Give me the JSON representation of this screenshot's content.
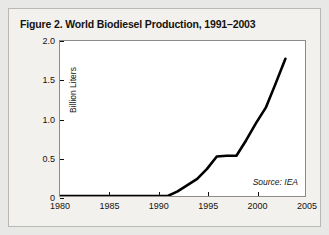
{
  "figure": {
    "title": "Figure 2. World Biodiesel Production, 1991–2003",
    "source_note": "Source: IEA"
  },
  "chart_data": {
    "type": "line",
    "title": "Figure 2. World Biodiesel Production, 1991–2003",
    "xlabel": "",
    "ylabel": "Billion Liters",
    "xlim": [
      1980,
      2005
    ],
    "ylim": [
      0,
      2.0
    ],
    "grid": false,
    "legend": null,
    "annotations": [
      "Source: IEA"
    ],
    "xticks": [
      1980,
      1985,
      1990,
      1995,
      2000,
      2005
    ],
    "xtick_labels": [
      "1980",
      "1985",
      "1990",
      "1995",
      "2000",
      "2005"
    ],
    "yticks": [
      0,
      0.5,
      1.0,
      1.5,
      2.0
    ],
    "ytick_labels": [
      "0",
      "0.5",
      "1.0",
      "1.5",
      "2.0"
    ],
    "line_color": "#000000",
    "line_width": 2.6,
    "x": [
      1991,
      1992,
      1993,
      1994,
      1995,
      1996,
      1997,
      1998,
      1999,
      2000,
      2001,
      2002,
      2003
    ],
    "values": [
      0.0,
      0.06,
      0.14,
      0.22,
      0.35,
      0.51,
      0.52,
      0.52,
      0.72,
      0.94,
      1.14,
      1.45,
      1.77
    ],
    "series": [
      {
        "name": "World biodiesel production",
        "values": [
          0.0,
          0.06,
          0.14,
          0.22,
          0.35,
          0.51,
          0.52,
          0.52,
          0.72,
          0.94,
          1.14,
          1.45,
          1.77
        ]
      }
    ]
  }
}
